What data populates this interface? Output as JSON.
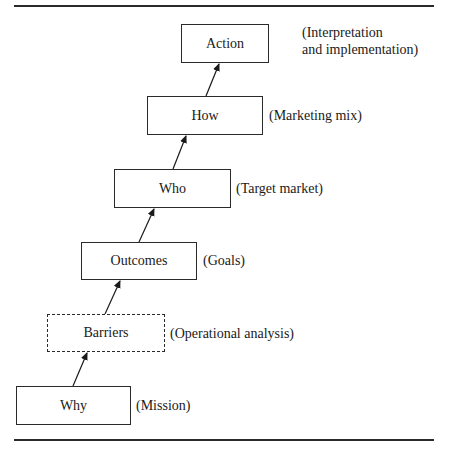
{
  "diagram": {
    "type": "flow-ladder",
    "colors": {
      "line": "#2a2a2a",
      "background": "#ffffff"
    },
    "steps": [
      {
        "label": "Why",
        "note_lines": [
          "(Mission)"
        ],
        "style": "solid"
      },
      {
        "label": "Barriers",
        "note_lines": [
          "(Operational analysis)"
        ],
        "style": "dashed"
      },
      {
        "label": "Outcomes",
        "note_lines": [
          "(Goals)"
        ],
        "style": "solid"
      },
      {
        "label": "Who",
        "note_lines": [
          "(Target market)"
        ],
        "style": "solid"
      },
      {
        "label": "How",
        "note_lines": [
          "(Marketing mix)"
        ],
        "style": "solid"
      },
      {
        "label": "Action",
        "note_lines": [
          "(Interpretation",
          "and implementation)"
        ],
        "style": "solid"
      }
    ],
    "edges": [
      {
        "from": "Why",
        "to": "Barriers"
      },
      {
        "from": "Barriers",
        "to": "Outcomes"
      },
      {
        "from": "Outcomes",
        "to": "Who"
      },
      {
        "from": "Who",
        "to": "How"
      },
      {
        "from": "How",
        "to": "Action"
      }
    ]
  }
}
